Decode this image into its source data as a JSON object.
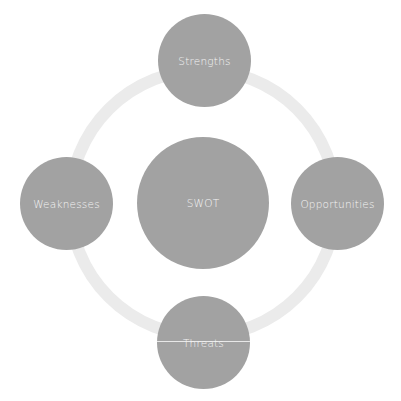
{
  "diagram": {
    "title": "SWOT",
    "center": {
      "label": "SWOT"
    },
    "nodes": [
      {
        "id": "strengths",
        "label": "Strengths"
      },
      {
        "id": "opportunities",
        "label": "Opportunities"
      },
      {
        "id": "threats",
        "label": "Threats"
      },
      {
        "id": "weaknesses",
        "label": "Weaknesses"
      }
    ],
    "colors": {
      "node_fill": "#a2a2a2",
      "ring": "#ebebeb",
      "text": "#f4f4f4",
      "background": "#ffffff"
    }
  }
}
